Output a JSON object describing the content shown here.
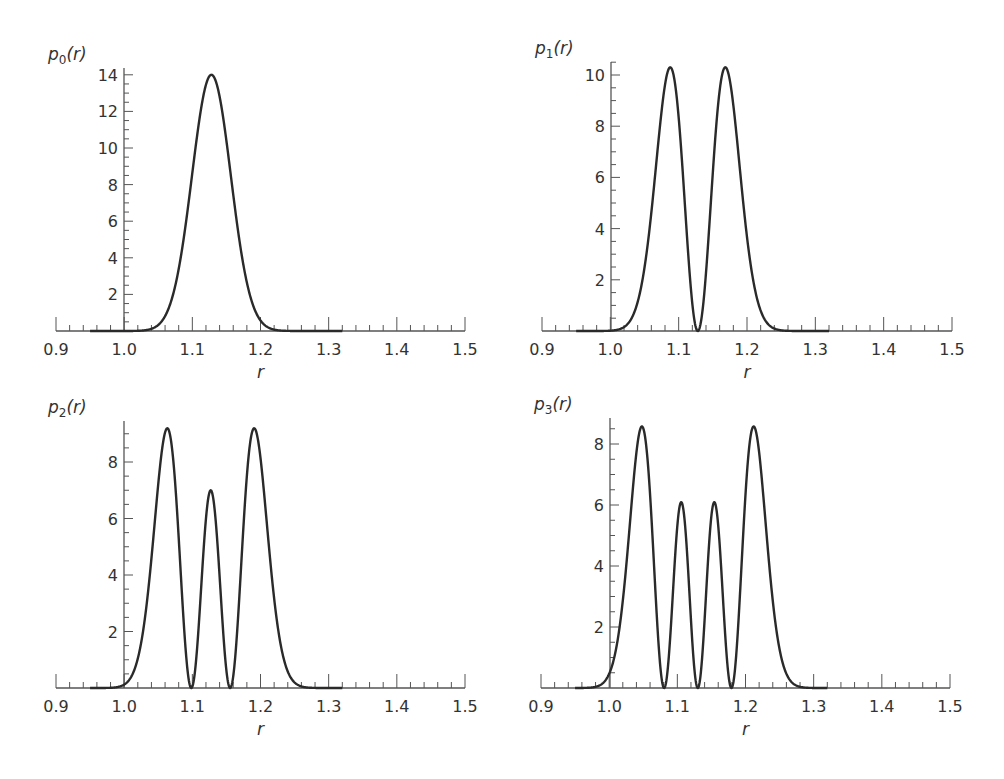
{
  "figure": {
    "background": "#ffffff",
    "line_color": "#2a2a2a",
    "axis_color": "#555555"
  },
  "chart_data": [
    {
      "type": "line",
      "id": "p0",
      "title": "",
      "ylabel": "p0(r)",
      "ylabel_main": "p",
      "ylabel_sub": "0",
      "ylabel_tail": "(r)",
      "xlabel": "r",
      "xlim": [
        0.9,
        1.5
      ],
      "ylim": [
        0,
        14.3
      ],
      "xticks": [
        "0.9",
        "1.0",
        "1.1",
        "1.2",
        "1.3",
        "1.4",
        "1.5"
      ],
      "yticks": [
        "2",
        "4",
        "6",
        "8",
        "10",
        "12",
        "14"
      ],
      "grid": false,
      "model": {
        "n": 0,
        "r0": 1.128,
        "a": 0.0403
      },
      "peaks": [
        {
          "r": 1.128,
          "p": 14.0
        }
      ],
      "zeros": [],
      "pixel_box": {
        "left": 56,
        "right": 465,
        "yaxis_x": 124,
        "baseline": 331,
        "top": 68,
        "px_per_unit": 18.3
      },
      "x": [
        1.0,
        1.04,
        1.06,
        1.08,
        1.1,
        1.12,
        1.128,
        1.14,
        1.16,
        1.18,
        1.2,
        1.22,
        1.25
      ],
      "values": [
        0.0,
        0.1,
        1.0,
        4.0,
        8.8,
        13.5,
        14.0,
        13.2,
        7.3,
        2.6,
        0.6,
        0.1,
        0.0
      ]
    },
    {
      "type": "line",
      "id": "p1",
      "ylabel": "p1(r)",
      "ylabel_main": "p",
      "ylabel_sub": "1",
      "ylabel_tail": "(r)",
      "xlabel": "r",
      "xlim": [
        0.9,
        1.5
      ],
      "ylim": [
        0,
        10.6
      ],
      "xticks": [
        "0.9",
        "1.0",
        "1.1",
        "1.2",
        "1.3",
        "1.4",
        "1.5"
      ],
      "yticks": [
        "2",
        "4",
        "6",
        "8",
        "10"
      ],
      "grid": false,
      "model": {
        "n": 1,
        "r0": 1.128,
        "a": 0.0403
      },
      "peaks": [
        {
          "r": 1.086,
          "p": 10.3
        },
        {
          "r": 1.172,
          "p": 10.3
        }
      ],
      "zeros": [
        1.128
      ],
      "pixel_box": {
        "left": 542,
        "right": 952,
        "yaxis_x": 611,
        "baseline": 331,
        "top": 62,
        "px_per_unit": 25.6
      },
      "x": [
        1.0,
        1.04,
        1.06,
        1.086,
        1.1,
        1.12,
        1.128,
        1.14,
        1.16,
        1.172,
        1.2,
        1.22,
        1.26
      ],
      "values": [
        0.0,
        1.5,
        5.5,
        10.3,
        7.5,
        1.2,
        0.0,
        1.2,
        8.5,
        10.3,
        6.0,
        2.0,
        0.0
      ]
    },
    {
      "type": "line",
      "id": "p2",
      "ylabel": "p2(r)",
      "ylabel_main": "p",
      "ylabel_sub": "2",
      "ylabel_tail": "(r)",
      "xlabel": "r",
      "xlim": [
        0.9,
        1.5
      ],
      "ylim": [
        0,
        9.4
      ],
      "xticks": [
        "0.9",
        "1.0",
        "1.1",
        "1.2",
        "1.3",
        "1.4",
        "1.5"
      ],
      "yticks": [
        "2",
        "4",
        "6",
        "8"
      ],
      "grid": false,
      "model": {
        "n": 2,
        "r0": 1.127,
        "a": 0.0403
      },
      "peaks": [
        {
          "r": 1.068,
          "p": 9.2
        },
        {
          "r": 1.127,
          "p": 6.8
        },
        {
          "r": 1.186,
          "p": 9.2
        }
      ],
      "zeros": [
        1.099,
        1.155
      ],
      "pixel_box": {
        "left": 56,
        "right": 465,
        "yaxis_x": 124,
        "baseline": 688,
        "top": 421,
        "px_per_unit": 28.25
      },
      "x": [
        1.0,
        1.04,
        1.068,
        1.09,
        1.099,
        1.11,
        1.127,
        1.145,
        1.155,
        1.17,
        1.186,
        1.21,
        1.25
      ],
      "values": [
        0.1,
        4.5,
        9.2,
        3.5,
        0.0,
        2.5,
        6.8,
        2.5,
        0.0,
        3.5,
        9.2,
        4.5,
        0.2
      ]
    },
    {
      "type": "line",
      "id": "p3",
      "ylabel": "p3(r)",
      "ylabel_main": "p",
      "ylabel_sub": "3",
      "ylabel_tail": "(r)",
      "xlabel": "r",
      "xlim": [
        0.9,
        1.5
      ],
      "ylim": [
        0,
        8.8
      ],
      "xticks": [
        "0.9",
        "1.0",
        "1.1",
        "1.2",
        "1.3",
        "1.4",
        "1.5"
      ],
      "yticks": [
        "2",
        "4",
        "6",
        "8"
      ],
      "grid": false,
      "model": {
        "n": 3,
        "r0": 1.13,
        "a": 0.0403
      },
      "peaks": [
        {
          "r": 1.047,
          "p": 8.6
        },
        {
          "r": 1.106,
          "p": 6.1
        },
        {
          "r": 1.153,
          "p": 6.1
        },
        {
          "r": 1.215,
          "p": 8.6
        }
      ],
      "zeros": [
        1.081,
        1.13,
        1.18
      ],
      "pixel_box": {
        "left": 541,
        "right": 950,
        "yaxis_x": 610,
        "baseline": 688,
        "top": 418,
        "px_per_unit": 30.5
      },
      "x": [
        0.98,
        1.0,
        1.047,
        1.081,
        1.106,
        1.13,
        1.153,
        1.18,
        1.215,
        1.26,
        1.28
      ],
      "values": [
        0.0,
        0.5,
        8.6,
        0.0,
        6.1,
        0.0,
        6.1,
        0.0,
        8.6,
        0.5,
        0.0
      ]
    }
  ]
}
